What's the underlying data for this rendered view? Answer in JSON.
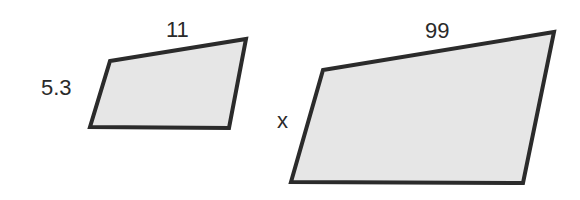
{
  "diagram": {
    "small_shape": {
      "top_side_label": "11",
      "left_side_label": "5.3",
      "points": "110,61 246,39 229,128 90,127"
    },
    "large_shape": {
      "top_side_label": "99",
      "left_side_label": "x",
      "points": "323,70 554,32 523,183 291,182"
    },
    "colors": {
      "fill": "#e6e6e6",
      "stroke": "#2b2b2b"
    }
  }
}
